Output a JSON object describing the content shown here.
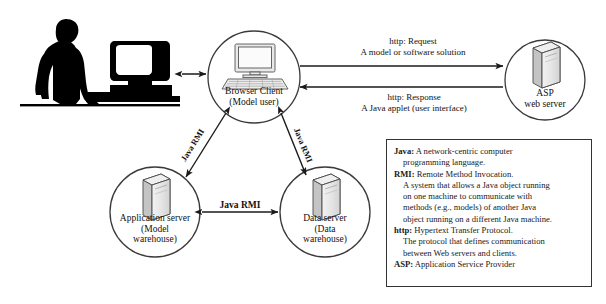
{
  "diagram": {
    "background_color": "#ffffff",
    "stroke_color": "#333333"
  },
  "actor": {
    "name": "user-at-workstation-silhouette",
    "description": "Person standing at desk with desktop computer"
  },
  "nodes": [
    {
      "id": "browser-client",
      "icon": "desktop-computer-icon",
      "line1": "Browser Client",
      "line2": "(Model user)",
      "cx": 254,
      "cy": 77,
      "r": 46
    },
    {
      "id": "asp-web-server",
      "icon": "server-tower-icon",
      "line1": "ASP",
      "line2": "web server",
      "cx": 545,
      "cy": 80,
      "r": 40
    },
    {
      "id": "application-server",
      "icon": "server-tower-icon",
      "line1": "Application server",
      "line2": "(Model",
      "line3": "warehouse)",
      "cx": 155,
      "cy": 212,
      "r": 45
    },
    {
      "id": "data-server",
      "icon": "server-tower-icon",
      "line1": "Data server",
      "line2": "(Data",
      "line3": "warehouse)",
      "cx": 325,
      "cy": 212,
      "r": 45
    }
  ],
  "edges": {
    "user_to_browser": {
      "type": "double-arrow",
      "label": ""
    },
    "http_request": {
      "line1": "http: Request",
      "line2": "A model or software solution",
      "direction": "browser-to-server"
    },
    "http_response": {
      "line1": "http: Response",
      "line2": "A Java applet (user interface)",
      "direction": "server-to-browser"
    },
    "rmi_left": {
      "label": "Java RMI",
      "orientation": "diagonal",
      "type": "double-arrow"
    },
    "rmi_right": {
      "label": "Java RMI",
      "orientation": "diagonal",
      "type": "double-arrow"
    },
    "rmi_bottom": {
      "label": "Java RMI",
      "orientation": "horizontal",
      "type": "double-arrow"
    }
  },
  "legend": {
    "entries": [
      {
        "term": "Java:",
        "text": " A network-centric computer",
        "continuation": [
          "programming language."
        ]
      },
      {
        "term": "RMI:",
        "text": " Remote Method Invocation.",
        "continuation": [
          "A system that allows a Java object running",
          "on one machine to communicate with",
          "methods (e.g., models) of another Java",
          "object running on a different Java machine."
        ]
      },
      {
        "term": "http:",
        "text": " Hypertext Transfer Protocol.",
        "continuation": [
          "The protocol that defines communication",
          "between Web servers and clients."
        ]
      },
      {
        "term": "ASP:",
        "text": " Application Service Provider",
        "continuation": []
      }
    ]
  }
}
